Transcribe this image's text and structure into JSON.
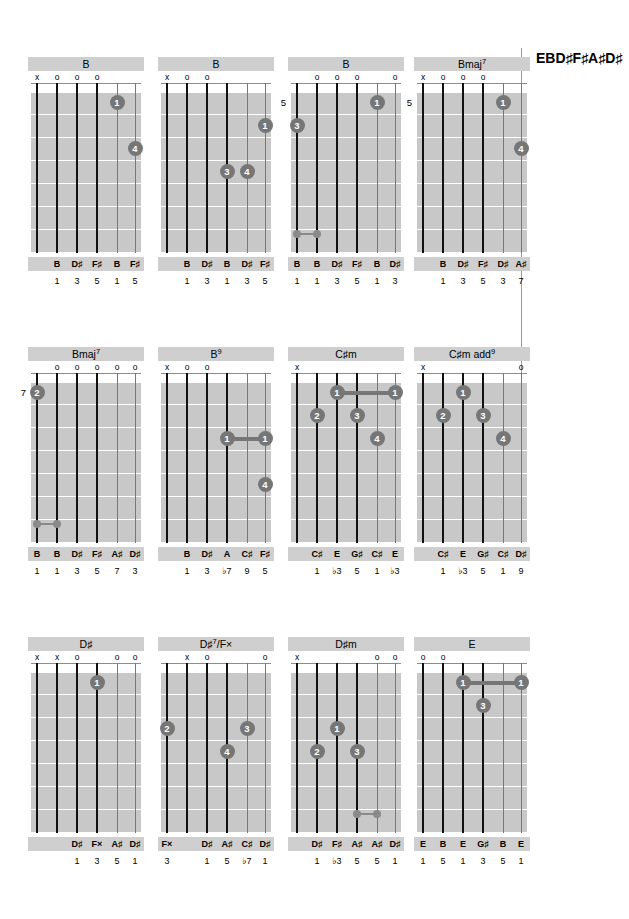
{
  "tuning": "EBD♯F♯A♯D♯",
  "layout": {
    "columns_x": [
      28,
      158,
      288,
      414
    ],
    "rows_y": [
      57,
      347,
      637
    ],
    "string_x": [
      6,
      26,
      46,
      66,
      86,
      104
    ],
    "fret_y": [
      8,
      31,
      54,
      77,
      100,
      123,
      146,
      169
    ]
  },
  "chords": [
    {
      "name": "B",
      "name_html": "B",
      "fret_label": "",
      "markers": [
        "x",
        "o",
        "o",
        "o",
        "",
        ""
      ],
      "dots": [
        {
          "string": 5,
          "fret": 1,
          "finger": "1"
        },
        {
          "string": 6,
          "fret": 3,
          "finger": "4"
        }
      ],
      "barres": [],
      "barre_indicator": null,
      "notes": [
        "",
        "B",
        "D♯",
        "F♯",
        "B",
        "F♯"
      ],
      "intervals": [
        "",
        "1",
        "3",
        "5",
        "1",
        "5"
      ]
    },
    {
      "name": "B",
      "name_html": "B",
      "fret_label": "",
      "markers": [
        "x",
        "o",
        "o",
        "",
        "",
        ""
      ],
      "dots": [
        {
          "string": 6,
          "fret": 2,
          "finger": "1"
        },
        {
          "string": 4,
          "fret": 4,
          "finger": "3"
        },
        {
          "string": 5,
          "fret": 4,
          "finger": "4"
        }
      ],
      "barres": [],
      "barre_indicator": null,
      "notes": [
        "",
        "B",
        "D♯",
        "B",
        "D♯",
        "F♯"
      ],
      "intervals": [
        "",
        "1",
        "3",
        "1",
        "3",
        "5"
      ]
    },
    {
      "name": "B",
      "name_html": "B",
      "fret_label": "5",
      "markers": [
        "",
        "o",
        "o",
        "o",
        "",
        "o"
      ],
      "dots": [
        {
          "string": 1,
          "fret": 2,
          "finger": "3"
        },
        {
          "string": 5,
          "fret": 1,
          "finger": "1"
        }
      ],
      "barres": [],
      "barre_indicator": {
        "from": 1,
        "to": 2
      },
      "notes": [
        "B",
        "B",
        "D♯",
        "F♯",
        "B",
        "D♯"
      ],
      "intervals": [
        "1",
        "1",
        "3",
        "5",
        "1",
        "3"
      ]
    },
    {
      "name": "Bmaj7",
      "name_html": "Bmaj<sup>7</sup>",
      "fret_label": "5",
      "markers": [
        "x",
        "o",
        "o",
        "o",
        "",
        ""
      ],
      "dots": [
        {
          "string": 5,
          "fret": 1,
          "finger": "1"
        },
        {
          "string": 6,
          "fret": 3,
          "finger": "4"
        }
      ],
      "barres": [],
      "barre_indicator": null,
      "notes": [
        "",
        "B",
        "D♯",
        "F♯",
        "D♯",
        "A♯"
      ],
      "intervals": [
        "",
        "1",
        "3",
        "5",
        "3",
        "7"
      ]
    },
    {
      "name": "Bmaj7",
      "name_html": "Bmaj<sup>7</sup>",
      "fret_label": "7",
      "markers": [
        "",
        "o",
        "o",
        "o",
        "o",
        "o"
      ],
      "dots": [
        {
          "string": 1,
          "fret": 1,
          "finger": "2"
        }
      ],
      "barres": [],
      "barre_indicator": {
        "from": 1,
        "to": 2
      },
      "notes": [
        "B",
        "B",
        "D♯",
        "F♯",
        "A♯",
        "D♯"
      ],
      "intervals": [
        "1",
        "1",
        "3",
        "5",
        "7",
        "3"
      ]
    },
    {
      "name": "B9",
      "name_html": "B<sup>9</sup>",
      "fret_label": "",
      "markers": [
        "x",
        "o",
        "o",
        "",
        "",
        ""
      ],
      "dots": [
        {
          "string": 4,
          "fret": 3,
          "finger": "1"
        },
        {
          "string": 6,
          "fret": 3,
          "finger": "1"
        },
        {
          "string": 6,
          "fret": 5,
          "finger": "4"
        }
      ],
      "barres": [
        {
          "fret": 3,
          "from": 4,
          "to": 6
        }
      ],
      "barre_indicator": null,
      "notes": [
        "",
        "B",
        "D♯",
        "A",
        "C♯",
        "F♯"
      ],
      "intervals": [
        "",
        "1",
        "3",
        "♭7",
        "9",
        "5"
      ]
    },
    {
      "name": "C♯m",
      "name_html": "C♯m",
      "fret_label": "",
      "markers": [
        "x",
        "",
        "",
        "",
        "",
        ""
      ],
      "dots": [
        {
          "string": 3,
          "fret": 1,
          "finger": "1"
        },
        {
          "string": 6,
          "fret": 1,
          "finger": "1"
        },
        {
          "string": 2,
          "fret": 2,
          "finger": "2"
        },
        {
          "string": 4,
          "fret": 2,
          "finger": "3"
        },
        {
          "string": 5,
          "fret": 3,
          "finger": "4"
        }
      ],
      "barres": [
        {
          "fret": 1,
          "from": 3,
          "to": 6
        }
      ],
      "barre_indicator": null,
      "notes": [
        "",
        "C♯",
        "E",
        "G♯",
        "C♯",
        "E"
      ],
      "intervals": [
        "",
        "1",
        "♭3",
        "5",
        "1",
        "♭3"
      ]
    },
    {
      "name": "C♯m add9",
      "name_html": "C♯m add<sup>9</sup>",
      "fret_label": "",
      "markers": [
        "x",
        "",
        "",
        "",
        "",
        "o"
      ],
      "dots": [
        {
          "string": 3,
          "fret": 1,
          "finger": "1"
        },
        {
          "string": 2,
          "fret": 2,
          "finger": "2"
        },
        {
          "string": 4,
          "fret": 2,
          "finger": "3"
        },
        {
          "string": 5,
          "fret": 3,
          "finger": "4"
        }
      ],
      "barres": [],
      "barre_indicator": null,
      "notes": [
        "",
        "C♯",
        "E",
        "G♯",
        "C♯",
        "D♯"
      ],
      "intervals": [
        "",
        "1",
        "♭3",
        "5",
        "1",
        "9"
      ]
    },
    {
      "name": "D♯",
      "name_html": "D♯",
      "fret_label": "",
      "markers": [
        "x",
        "x",
        "o",
        "",
        "o",
        "o"
      ],
      "dots": [
        {
          "string": 4,
          "fret": 1,
          "finger": "1"
        }
      ],
      "barres": [],
      "barre_indicator": null,
      "notes": [
        "",
        "",
        "D♯",
        "F×",
        "A♯",
        "D♯"
      ],
      "intervals": [
        "",
        "",
        "1",
        "3",
        "5",
        "1"
      ]
    },
    {
      "name": "D♯7/F×",
      "name_html": "D♯<sup>7</sup>/F×",
      "fret_label": "",
      "markers": [
        "",
        "x",
        "o",
        "",
        "",
        "o"
      ],
      "dots": [
        {
          "string": 1,
          "fret": 3,
          "finger": "2"
        },
        {
          "string": 5,
          "fret": 3,
          "finger": "3"
        },
        {
          "string": 4,
          "fret": 4,
          "finger": "4"
        }
      ],
      "barres": [],
      "barre_indicator": null,
      "notes": [
        "F×",
        "",
        "D♯",
        "A♯",
        "C♯",
        "D♯"
      ],
      "intervals": [
        "3",
        "",
        "1",
        "5",
        "♭7",
        "1"
      ]
    },
    {
      "name": "D♯m",
      "name_html": "D♯m",
      "fret_label": "",
      "markers": [
        "x",
        "",
        "",
        "",
        "o",
        "o"
      ],
      "dots": [
        {
          "string": 3,
          "fret": 3,
          "finger": "1"
        },
        {
          "string": 2,
          "fret": 4,
          "finger": "2"
        },
        {
          "string": 4,
          "fret": 4,
          "finger": "3"
        }
      ],
      "barres": [],
      "barre_indicator": {
        "from": 4,
        "to": 5
      },
      "notes": [
        "",
        "D♯",
        "F♯",
        "A♯",
        "A♯",
        "D♯"
      ],
      "intervals": [
        "",
        "1",
        "♭3",
        "5",
        "5",
        "1"
      ]
    },
    {
      "name": "E",
      "name_html": "E",
      "fret_label": "",
      "markers": [
        "o",
        "o",
        "",
        "",
        "",
        ""
      ],
      "dots": [
        {
          "string": 3,
          "fret": 1,
          "finger": "1"
        },
        {
          "string": 6,
          "fret": 1,
          "finger": "1"
        },
        {
          "string": 4,
          "fret": 2,
          "finger": "3"
        }
      ],
      "barres": [
        {
          "fret": 1,
          "from": 3,
          "to": 6
        }
      ],
      "barre_indicator": null,
      "notes": [
        "E",
        "B",
        "E",
        "G♯",
        "B",
        "E"
      ],
      "intervals": [
        "1",
        "5",
        "1",
        "3",
        "5",
        "1"
      ]
    }
  ]
}
